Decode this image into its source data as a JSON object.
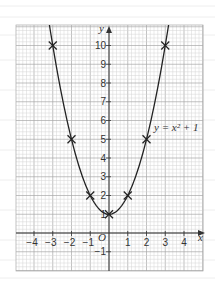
{
  "chart_data": {
    "type": "line",
    "title": "",
    "function": "y = x^2 + 1",
    "curve_label": "y = x² + 1",
    "xlabel": "x",
    "ylabel": "y",
    "origin_label": "O",
    "xlim": [
      -5,
      5
    ],
    "ylim": [
      -2,
      11
    ],
    "x_ticks": [
      -4,
      -3,
      -2,
      -1,
      1,
      2,
      3,
      4
    ],
    "x_tick_labels": [
      "−4",
      "−3",
      "−2",
      "−1",
      "1",
      "2",
      "3",
      "4"
    ],
    "y_ticks": [
      -1,
      1,
      2,
      3,
      4,
      5,
      6,
      7,
      8,
      9,
      10
    ],
    "y_tick_labels": [
      "−1",
      "1",
      "2",
      "3",
      "4",
      "5",
      "6",
      "7",
      "8",
      "9",
      "10"
    ],
    "grid": true,
    "grid_minor_per_unit": 5,
    "series": [
      {
        "name": "y = x² + 1",
        "marker": "x",
        "x": [
          -3,
          -2,
          -1,
          0,
          1,
          2,
          3
        ],
        "y": [
          10,
          5,
          2,
          1,
          2,
          5,
          10
        ]
      }
    ]
  },
  "colors": {
    "background": "#ffffff",
    "grid_minor": "#d4d4d4",
    "grid_major": "#a8a8a8",
    "axis": "#333333",
    "curve": "#222222",
    "page_lines": "#eeeeee"
  }
}
